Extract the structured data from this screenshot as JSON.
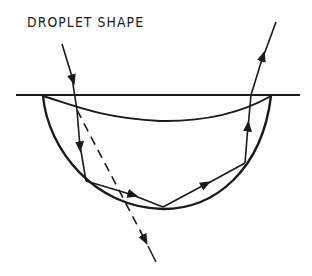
{
  "title": "DROPLET SHAPE",
  "colors": {
    "stroke": "#1a1a1a",
    "background": "#ffffff"
  },
  "elements": {
    "surface_line": "horizontal surface line",
    "droplet_outline": "droplet lower boundary (circular arc)",
    "droplet_upper_curve": "droplet upper surface (meniscus curve)",
    "incident_ray": "incoming ray with arrow",
    "undeviated_ray": "dashed continuation of incident ray with arrow",
    "internal_rays": "internally reflected ray path with arrows",
    "exit_ray": "exiting ray with arrow"
  }
}
